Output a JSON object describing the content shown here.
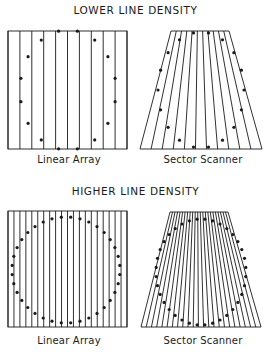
{
  "sections": [
    {
      "heading": "LOWER LINE DENSITY",
      "heading_y": 4,
      "panels": [
        {
          "type": "linear",
          "caption": "Linear Array",
          "caption_x": 30,
          "caption_y": 154,
          "caption_w": 78,
          "box": {
            "x0": 8,
            "x1": 127,
            "y0": 31,
            "y1": 149
          },
          "lines": 11,
          "ellipse": {
            "cx": 68,
            "cy": 90,
            "rx": 48,
            "ry": 60
          },
          "dots": 16
        },
        {
          "type": "sector",
          "caption": "Sector Scanner",
          "caption_x": 158,
          "caption_y": 154,
          "caption_w": 90,
          "trap": {
            "tx0": 171,
            "tx1": 229,
            "bx0": 140,
            "bx1": 262,
            "y0": 31,
            "y1": 149
          },
          "lines": 12,
          "ellipse": {
            "cx": 201,
            "cy": 90,
            "rx": 43,
            "ry": 58
          },
          "dots": 18
        }
      ]
    },
    {
      "heading": "HIGHER LINE DENSITY",
      "heading_y": 185,
      "panels": [
        {
          "type": "linear",
          "caption": "Linear Array",
          "caption_x": 30,
          "caption_y": 335,
          "caption_w": 78,
          "box": {
            "x0": 8,
            "x1": 127,
            "y0": 211,
            "y1": 327
          },
          "lines": 21,
          "ellipse": {
            "cx": 66,
            "cy": 270,
            "rx": 54,
            "ry": 53
          },
          "dots": 36
        },
        {
          "type": "sector",
          "caption": "Sector Scanner",
          "caption_x": 158,
          "caption_y": 335,
          "caption_w": 90,
          "trap": {
            "tx0": 170,
            "tx1": 228,
            "bx0": 141,
            "bx1": 261,
            "y0": 212,
            "y1": 327
          },
          "lines": 24,
          "ellipse": {
            "cx": 201,
            "cy": 272,
            "rx": 45,
            "ry": 53
          },
          "dots": 36
        }
      ]
    }
  ],
  "colors": {
    "ink": "#1a1a1a",
    "background": "#ffffff"
  }
}
